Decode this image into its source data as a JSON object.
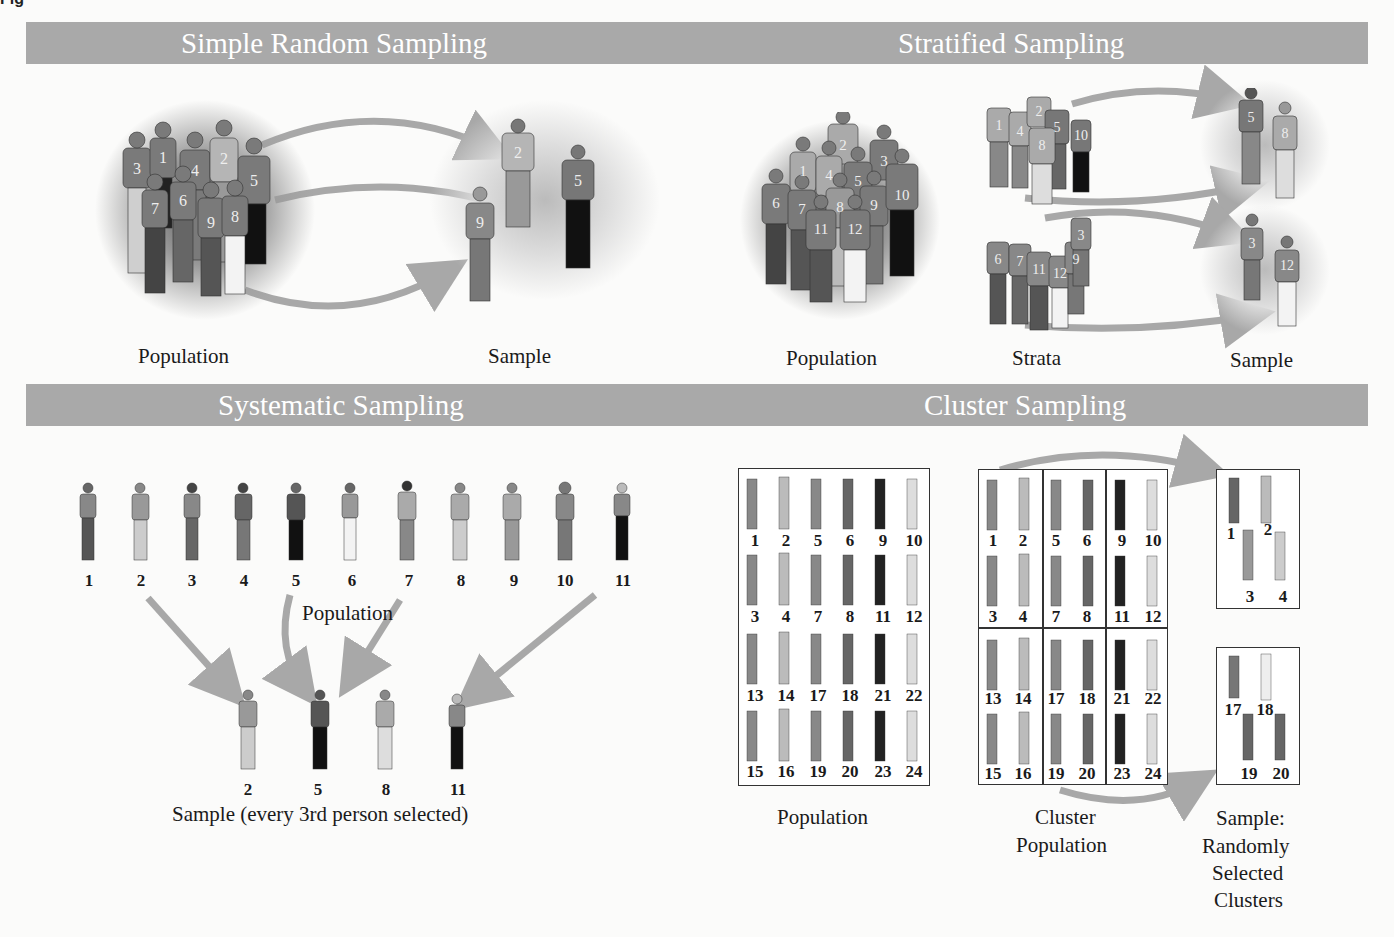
{
  "figure_label_clipped": "Fig",
  "panels": {
    "simple_random": {
      "title": "Simple Random Sampling",
      "population_label": "Population",
      "sample_label": "Sample",
      "population_numbers": [
        "1",
        "2",
        "3",
        "4",
        "5",
        "6",
        "7",
        "8",
        "9"
      ],
      "sample_numbers": [
        "2",
        "5",
        "9"
      ]
    },
    "stratified": {
      "title": "Stratified Sampling",
      "population_label": "Population",
      "strata_label": "Strata",
      "sample_label": "Sample",
      "population_numbers": [
        "1",
        "2",
        "3",
        "4",
        "5",
        "6",
        "7",
        "8",
        "9",
        "10",
        "11",
        "12"
      ],
      "strata": [
        {
          "numbers": [
            "1",
            "2",
            "4",
            "5",
            "8",
            "10"
          ]
        },
        {
          "numbers": [
            "3",
            "6",
            "7",
            "9",
            "11",
            "12"
          ]
        }
      ],
      "sample_groups": [
        {
          "numbers": [
            "5",
            "8"
          ]
        },
        {
          "numbers": [
            "3",
            "12"
          ]
        }
      ]
    },
    "systematic": {
      "title": "Systematic Sampling",
      "population_label": "Population",
      "sample_label": "Sample (every 3rd person selected)",
      "population_numbers": [
        "1",
        "2",
        "3",
        "4",
        "5",
        "6",
        "7",
        "8",
        "9",
        "10",
        "11"
      ],
      "sample_numbers": [
        "2",
        "5",
        "8",
        "11"
      ]
    },
    "cluster": {
      "title": "Cluster Sampling",
      "population_label": "Population",
      "cluster_population_label_1": "Cluster",
      "cluster_population_label_2": "Population",
      "sample_label_1": "Sample:",
      "sample_label_2": "Randomly",
      "sample_label_3": "Selected",
      "sample_label_4": "Clusters",
      "population_rows": [
        [
          "1",
          "2",
          "5",
          "6",
          "9",
          "10"
        ],
        [
          "3",
          "4",
          "7",
          "8",
          "11",
          "12"
        ],
        [
          "13",
          "14",
          "17",
          "18",
          "21",
          "22"
        ],
        [
          "15",
          "16",
          "19",
          "20",
          "23",
          "24"
        ]
      ],
      "selected_clusters": [
        {
          "numbers": [
            "1",
            "2",
            "3",
            "4"
          ]
        },
        {
          "numbers": [
            "17",
            "18",
            "19",
            "20"
          ]
        }
      ]
    }
  },
  "colors": {
    "header_bar": "#a9a9a9",
    "header_text": "#ffffff",
    "arrow": "#a8a8a8",
    "background": "#fbfbfa"
  }
}
